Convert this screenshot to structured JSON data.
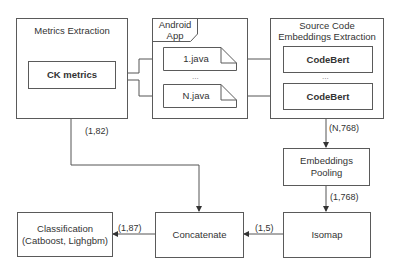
{
  "diagram": {
    "groups": {
      "metrics": {
        "title": "Metrics Extraction"
      },
      "android": {
        "title_line1": "Android",
        "title_line2": "App"
      },
      "source": {
        "title_line1": "Source Code",
        "title_line2": "Embeddings Extraction"
      }
    },
    "nodes": {
      "ck_metrics": "CK metrics",
      "file_1": "1.java",
      "file_n": "N.java",
      "files_ellipsis": "...",
      "codebert_1": "CodeBert",
      "codebert_n": "CodeBert",
      "codebert_ellipsis": "...",
      "pooling": "Embeddings Pooling",
      "isomap": "Isomap",
      "concatenate": "Concatenate",
      "classification_line1": "Classification",
      "classification_line2": "(Catboost, Lighgbm)"
    },
    "edges": {
      "metrics_to_concat": "(1,82)",
      "codebert_to_pooling": "(N,768)",
      "pooling_to_isomap": "(1,768)",
      "isomap_to_concat": "(1,5)",
      "concat_to_classification": "(1,87)"
    },
    "colors": {
      "stroke": "#5a5a5a",
      "text": "#333333",
      "background": "#ffffff"
    }
  }
}
